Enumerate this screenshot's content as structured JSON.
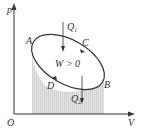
{
  "diagram": {
    "axes": {
      "y_label": "p",
      "x_label": "V",
      "origin_label": "O"
    },
    "points": {
      "A": "A",
      "B": "B",
      "C": "C",
      "D": "D"
    },
    "heat_in": {
      "symbol": "Q",
      "subscript": "1"
    },
    "heat_out": {
      "symbol": "Q",
      "subscript": "2"
    },
    "work_label": "W > 0",
    "colors": {
      "line": "#333333",
      "shade": "#d9d9d9"
    }
  }
}
